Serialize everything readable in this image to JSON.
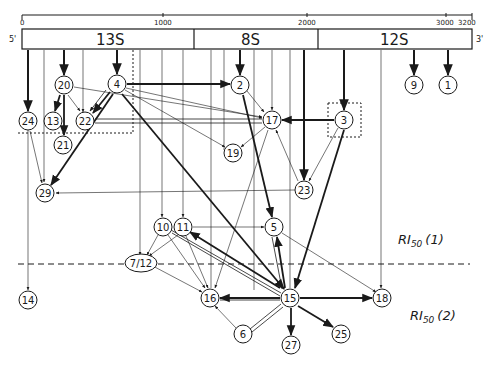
{
  "diagram": {
    "type": "ribosomal-protein-assembly-map",
    "scale": {
      "ticks": [
        {
          "label": "0",
          "x": 22
        },
        {
          "label": "1000",
          "x": 163
        },
        {
          "label": "2000",
          "x": 307
        },
        {
          "label": "3000",
          "x": 446
        },
        {
          "label": "3200",
          "x": 472
        }
      ]
    },
    "rna_bar": {
      "five_prime_label": "5'",
      "three_prime_label": "3'",
      "segments": [
        {
          "label": "13S",
          "x1": 22,
          "x2": 194
        },
        {
          "label": "8S",
          "x1": 194,
          "x2": 318
        },
        {
          "label": "12S",
          "x1": 318,
          "x2": 472
        }
      ]
    },
    "levels": [
      {
        "label": "RI",
        "sub": "50",
        "suffix": "(1)",
        "x": 400,
        "y": 240
      },
      {
        "label": "RI",
        "sub": "50",
        "suffix": "(2)",
        "x": 410,
        "y": 318
      }
    ],
    "nodes": [
      {
        "id": "1",
        "label": "1",
        "x": 448,
        "y": 85
      },
      {
        "id": "9",
        "label": "9",
        "x": 414,
        "y": 85
      },
      {
        "id": "20",
        "label": "20",
        "x": 64,
        "y": 85
      },
      {
        "id": "4",
        "label": "4",
        "x": 117,
        "y": 84
      },
      {
        "id": "2",
        "label": "2",
        "x": 240,
        "y": 85
      },
      {
        "id": "24",
        "label": "24",
        "x": 28,
        "y": 121
      },
      {
        "id": "13",
        "label": "13",
        "x": 53,
        "y": 121
      },
      {
        "id": "22",
        "label": "22",
        "x": 85,
        "y": 121
      },
      {
        "id": "17",
        "label": "17",
        "x": 272,
        "y": 120
      },
      {
        "id": "3",
        "label": "3",
        "x": 344,
        "y": 120
      },
      {
        "id": "21",
        "label": "21",
        "x": 63,
        "y": 145
      },
      {
        "id": "19",
        "label": "19",
        "x": 233,
        "y": 153
      },
      {
        "id": "29",
        "label": "29",
        "x": 45,
        "y": 193
      },
      {
        "id": "23",
        "label": "23",
        "x": 304,
        "y": 190
      },
      {
        "id": "10",
        "label": "10",
        "x": 163,
        "y": 227
      },
      {
        "id": "11",
        "label": "11",
        "x": 183,
        "y": 227
      },
      {
        "id": "5",
        "label": "5",
        "x": 274,
        "y": 227
      },
      {
        "id": "7/12",
        "label": "7/12",
        "x": 141,
        "y": 263
      },
      {
        "id": "14",
        "label": "14",
        "x": 28,
        "y": 300
      },
      {
        "id": "16",
        "label": "16",
        "x": 210,
        "y": 298
      },
      {
        "id": "15",
        "label": "15",
        "x": 290,
        "y": 298
      },
      {
        "id": "18",
        "label": "18",
        "x": 382,
        "y": 298
      },
      {
        "id": "6",
        "label": "6",
        "x": 243,
        "y": 334
      },
      {
        "id": "27",
        "label": "27",
        "x": 291,
        "y": 345
      },
      {
        "id": "25",
        "label": "25",
        "x": 341,
        "y": 334
      }
    ]
  }
}
